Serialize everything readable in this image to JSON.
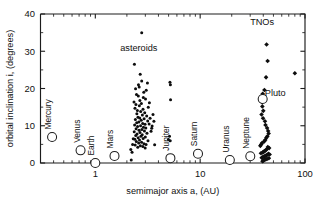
{
  "figure": {
    "name": "orbital-inclination-vs-semimajor-axis",
    "background": "#ffffff",
    "ink_color": "#111111"
  },
  "chart_data": {
    "type": "scatter",
    "title": "",
    "xlabel": "semimajor axis a, (AU)",
    "ylabel": "orbital inclination i, (degrees)",
    "xscale": "log",
    "yscale": "linear",
    "xlim": [
      0.3,
      100
    ],
    "ylim": [
      0,
      40
    ],
    "grid": false,
    "legend": "none",
    "xticks_major": [
      1,
      10,
      100
    ],
    "xticklabels": [
      "1",
      "10",
      "100"
    ],
    "yticks_major": [
      0,
      10,
      20,
      30,
      40
    ],
    "yticklabels": [
      "0",
      "10",
      "20",
      "30",
      "40"
    ],
    "ytick_minor_step": 5,
    "annotations": [
      {
        "text": "asteroids",
        "x": 2.6,
        "y": 30.0,
        "rotation": 0
      },
      {
        "text": "TNOs",
        "x": 39.0,
        "y": 37.0,
        "rotation": 0
      },
      {
        "text": "Pluto",
        "x": 52.0,
        "y": 18.0,
        "rotation": 0
      }
    ],
    "series": [
      {
        "name": "planets",
        "marker": "open-circle",
        "marker_size": 9,
        "color": "#ffffff",
        "edge_color": "#1c1c1c",
        "points": [
          {
            "label": "Mercury",
            "x": 0.387,
            "y": 7.0
          },
          {
            "label": "Venus",
            "x": 0.723,
            "y": 3.4
          },
          {
            "label": "Earth",
            "x": 1.0,
            "y": 0.0
          },
          {
            "label": "Mars",
            "x": 1.524,
            "y": 1.9
          },
          {
            "label": "Jupiter",
            "x": 5.203,
            "y": 1.3
          },
          {
            "label": "Saturn",
            "x": 9.537,
            "y": 2.5
          },
          {
            "label": "Uranus",
            "x": 19.19,
            "y": 0.8
          },
          {
            "label": "Neptune",
            "x": 30.07,
            "y": 1.8
          },
          {
            "label": "Pluto",
            "x": 39.48,
            "y": 17.2
          }
        ]
      },
      {
        "name": "asteroids",
        "marker": "filled-circle",
        "marker_size": 3.0,
        "color": "#0d0d0d",
        "x": [
          2.77,
          2.36,
          2.68,
          2.77,
          3.14,
          2.58,
          2.62,
          2.42,
          3.06,
          2.9,
          2.47,
          2.57,
          2.87,
          3.01,
          2.66,
          2.34,
          2.75,
          2.44,
          2.63,
          3.2,
          2.39,
          2.85,
          2.52,
          2.71,
          2.96,
          2.49,
          2.81,
          3.09,
          2.55,
          2.65,
          2.92,
          2.41,
          2.74,
          3.16,
          2.6,
          2.48,
          2.83,
          2.98,
          2.37,
          2.7,
          2.53,
          2.88,
          3.03,
          2.45,
          2.78,
          2.61,
          2.94,
          2.35,
          2.67,
          3.11,
          2.5,
          2.8,
          2.43,
          2.72,
          3.0,
          2.56,
          2.86,
          2.38,
          2.64,
          3.18,
          2.46,
          2.76,
          2.59,
          2.91,
          3.05,
          2.4,
          2.69,
          2.84,
          2.54,
          2.99,
          3.26,
          3.33,
          2.3,
          2.27,
          3.4,
          2.2,
          3.45,
          5.15,
          5.2,
          5.22,
          5.1,
          5.18,
          4.98,
          3.55,
          3.62,
          3.48,
          2.18,
          2.24,
          3.68,
          3.28
        ],
        "y": [
          35.0,
          26.5,
          23.8,
          22.0,
          21.5,
          21.0,
          20.4,
          19.9,
          19.5,
          19.0,
          18.4,
          18.0,
          17.6,
          17.2,
          16.8,
          16.4,
          16.0,
          15.7,
          15.4,
          15.0,
          14.7,
          14.4,
          14.1,
          13.8,
          13.5,
          13.2,
          12.9,
          12.6,
          12.3,
          12.1,
          11.9,
          11.7,
          11.5,
          11.3,
          11.0,
          10.8,
          10.6,
          10.4,
          10.2,
          10.0,
          9.8,
          9.6,
          9.4,
          9.2,
          9.0,
          8.8,
          8.6,
          8.4,
          8.2,
          8.0,
          7.8,
          7.6,
          7.4,
          7.2,
          7.0,
          6.8,
          6.6,
          6.4,
          6.2,
          6.0,
          5.8,
          5.6,
          5.4,
          5.2,
          5.0,
          4.8,
          4.6,
          4.4,
          4.2,
          4.0,
          10.5,
          12.0,
          6.5,
          5.0,
          8.5,
          0.8,
          9.3,
          21.7,
          21.0,
          17.0,
          7.2,
          6.0,
          6.3,
          13.0,
          11.2,
          9.9,
          3.6,
          2.9,
          4.9,
          16.2
        ]
      },
      {
        "name": "TNOs",
        "marker": "filled-diamond",
        "marker_size": 3.4,
        "color": "#0d0d0d",
        "x": [
          43.0,
          44.0,
          42.5,
          41.0,
          39.5,
          40.5,
          38.8,
          39.2,
          40.0,
          38.5,
          39.8,
          41.5,
          42.0,
          43.5,
          44.5,
          45.0,
          43.8,
          42.8,
          41.8,
          40.8,
          39.0,
          38.2,
          37.5,
          44.2,
          45.5,
          43.2,
          42.2,
          41.2,
          40.2,
          39.4,
          38.0,
          44.8,
          46.0,
          43.6,
          42.6,
          41.6,
          40.6,
          39.6,
          38.6,
          45.2,
          43.4,
          42.4,
          41.4,
          40.4,
          39.3,
          80.0
        ],
        "y": [
          31.8,
          27.4,
          23.0,
          19.6,
          18.6,
          17.0,
          16.4,
          15.2,
          14.0,
          13.0,
          12.0,
          11.2,
          10.2,
          9.4,
          8.6,
          7.9,
          7.2,
          6.8,
          6.2,
          5.8,
          5.4,
          5.0,
          4.6,
          4.3,
          4.0,
          3.7,
          3.4,
          3.2,
          3.0,
          2.8,
          2.6,
          2.5,
          2.3,
          2.2,
          2.0,
          1.9,
          1.7,
          1.6,
          1.4,
          1.3,
          1.1,
          1.0,
          0.9,
          0.7,
          0.5,
          24.1
        ]
      }
    ]
  }
}
